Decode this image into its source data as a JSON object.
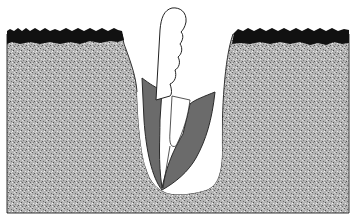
{
  "figure": {
    "title": "Planting hole with tool inserted in soil",
    "elements": {
      "soil": {
        "label": "soil",
        "color": "#a8a8a8",
        "speckle_color": "#6e6e6e"
      },
      "crust": {
        "label": "topsoil crust",
        "color": "#111111"
      },
      "hole": {
        "label": "planting hole",
        "color": "#ffffff"
      },
      "blade": {
        "label": "V-shaped blade",
        "color": "#6b6b6b"
      },
      "stem": {
        "label": "root / stem",
        "color": "#ffffff"
      }
    }
  }
}
